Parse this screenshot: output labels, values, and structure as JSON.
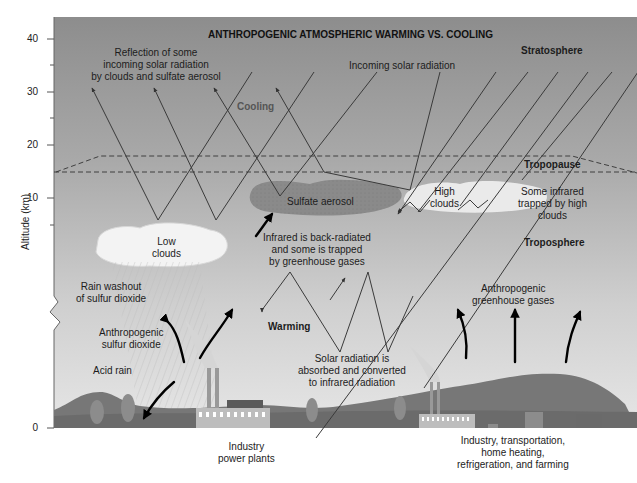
{
  "diagram": {
    "title": "ANTHROPOGENIC ATMOSPHERIC WARMING VS. COOLING",
    "y_axis": {
      "title": "Altitude (km)",
      "ticks": [
        "40",
        "30",
        "20",
        "10",
        "0"
      ]
    },
    "layers": {
      "stratosphere": "Stratosphere",
      "tropopause": "Tropopause",
      "troposphere": "Troposphere"
    },
    "labels": {
      "reflection": [
        "Reflection of some",
        "incoming solar radiation",
        "by clouds and sulfate aerosol"
      ],
      "incoming": "Incoming solar radiation",
      "cooling": "Cooling",
      "warming": "Warming",
      "sulfate_aerosol": "Sulfate aerosol",
      "low_clouds": [
        "Low",
        "clouds"
      ],
      "high_clouds": [
        "High",
        "clouds"
      ],
      "some_infrared": [
        "Some infrared",
        "trapped by high",
        "clouds"
      ],
      "backradiated": [
        "Infrared is back-radiated",
        "and some is trapped",
        "by greenhouse gases"
      ],
      "rain_washout": [
        "Rain washout",
        "of sulfur dioxide"
      ],
      "anthro_so2": [
        "Anthropogenic",
        "sulfur dioxide"
      ],
      "acid_rain": "Acid rain",
      "anthro_ghg": [
        "Anthropogenic",
        "greenhouse gases"
      ],
      "solar_absorbed": [
        "Solar radiation is",
        "absorbed and converted",
        "to infrared radiation"
      ],
      "industry_power": [
        "Industry",
        "power plants"
      ],
      "industry_transport": [
        "Industry, transportation,",
        "home heating,",
        "refrigeration, and farming"
      ]
    },
    "colors": {
      "sky_top": "#8f8f8f",
      "sky_bottom": "#e4e4e4",
      "ground": "#7a7a7a",
      "hills": "#6e6e6e",
      "aerosol": "#8a8a8a",
      "cloud": "#f2f2f2",
      "line": "#3a3a3a"
    }
  }
}
